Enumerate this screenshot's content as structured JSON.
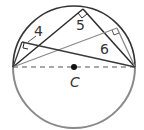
{
  "diagram": {
    "labels": {
      "side_a": "4",
      "side_b": "5",
      "side_c": "6",
      "center": "C"
    },
    "colors": {
      "dark": "#2b2b2b",
      "gray": "#8a8a8a",
      "circle_lower": "#8a8a8a",
      "circle_upper": "#333333"
    }
  }
}
